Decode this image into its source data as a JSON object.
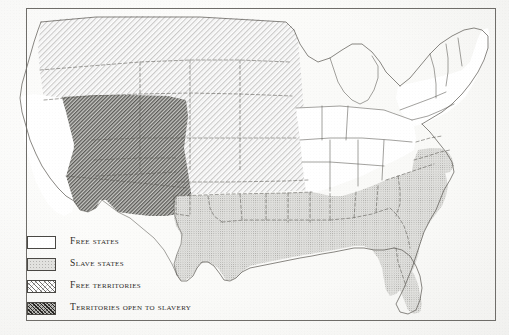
{
  "map": {
    "title": "United States — free states, slave states and territories",
    "frame": {
      "present": true,
      "color": "#6f6d69"
    },
    "background_color": "#fdfdfc",
    "categories": [
      {
        "key": "free_states",
        "label": "Free states",
        "fill": "#ffffff",
        "pattern": "none",
        "members": [
          "California",
          "Oregon",
          "Minnesota",
          "Wisconsin",
          "Iowa",
          "Illinois",
          "Michigan",
          "Indiana",
          "Ohio",
          "Pennsylvania",
          "New York",
          "New Jersey",
          "Connecticut",
          "Rhode Island",
          "Massachusetts",
          "Vermont",
          "New Hampshire",
          "Maine"
        ]
      },
      {
        "key": "slave_states",
        "label": "Slave states",
        "fill": "#e2e2df",
        "pattern": "stipple",
        "members": [
          "Texas",
          "Arkansas",
          "Louisiana",
          "Missouri",
          "Mississippi",
          "Alabama",
          "Tennessee",
          "Kentucky",
          "Georgia",
          "Florida",
          "South Carolina",
          "North Carolina",
          "Virginia",
          "Maryland",
          "Delaware"
        ]
      },
      {
        "key": "free_territories",
        "label": "Free territories",
        "fill": "#ffffff",
        "pattern": "sparse-diagonal-hatch",
        "members": [
          "Washington Territory",
          "Oregon Territory",
          "Nebraska Territory",
          "Kansas Territory",
          "Minnesota Territory"
        ]
      },
      {
        "key": "territories_open_to_slavery",
        "label": "Territories open to slavery",
        "fill": "#b9b9b5",
        "pattern": "dense-diagonal-hatch",
        "members": [
          "Utah Territory",
          "New Mexico Territory",
          "Indian Territory"
        ]
      }
    ]
  },
  "legend": {
    "items": [
      {
        "label": "Free states",
        "swatch": "free-states"
      },
      {
        "label": "Slave states",
        "swatch": "slave-states"
      },
      {
        "label": "Free territories",
        "swatch": "free-territories"
      },
      {
        "label": "Territories open to slavery",
        "swatch": "territories-open-to-slavery"
      }
    ]
  }
}
